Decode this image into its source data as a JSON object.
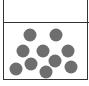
{
  "diagram": {
    "particle_color": "#6e6e6e",
    "particle_radius": 6.5,
    "particles": [
      {
        "x": 30,
        "y": 35
      },
      {
        "x": 56,
        "y": 35
      },
      {
        "x": 23,
        "y": 51
      },
      {
        "x": 43,
        "y": 51
      },
      {
        "x": 68,
        "y": 51
      },
      {
        "x": 55,
        "y": 61
      },
      {
        "x": 31,
        "y": 64
      },
      {
        "x": 16,
        "y": 69
      },
      {
        "x": 46,
        "y": 72
      },
      {
        "x": 71,
        "y": 67
      }
    ]
  }
}
